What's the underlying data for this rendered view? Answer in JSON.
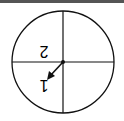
{
  "spinner": {
    "sections": [
      {
        "label": "2",
        "position": "upper-left",
        "rotated": true
      },
      {
        "label": "1",
        "position": "lower-left",
        "rotated": true
      },
      {
        "label": "",
        "position": "upper-right"
      },
      {
        "label": "",
        "position": "lower-right"
      }
    ],
    "arrow_direction": "lower-left",
    "stroke_color": "#111111"
  }
}
